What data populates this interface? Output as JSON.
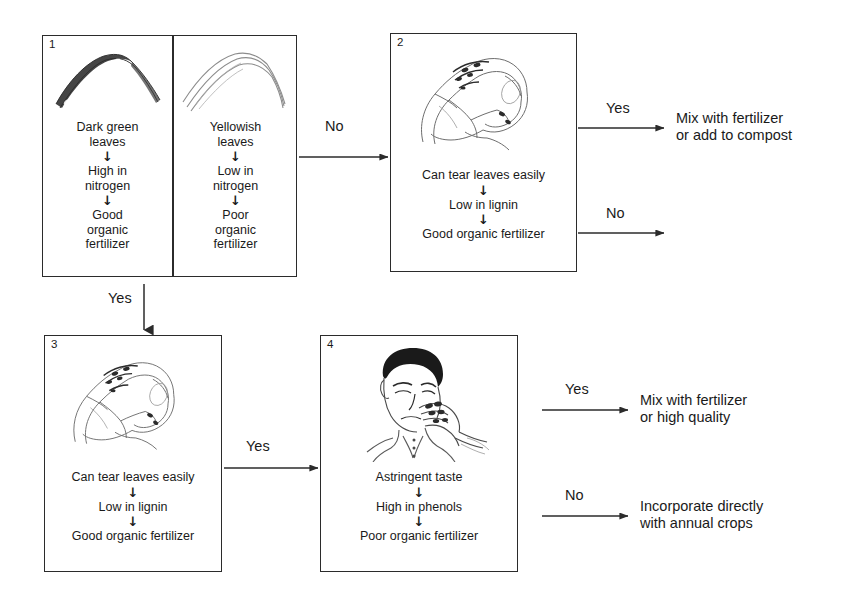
{
  "diagram": {
    "line_color": "#2b2b2b",
    "text_color": "#1a1a1a",
    "background": "#ffffff",
    "down_arrow_glyph": "↓"
  },
  "boxes": [
    {
      "id": "box-1",
      "number": "1",
      "panes": [
        {
          "id": "box-1-left",
          "sketch": "dark-green-leaf-sketch",
          "steps": [
            "Dark green\nleaves",
            "High in\nnitrogen",
            "Good\norganic\nfertilizer"
          ]
        },
        {
          "id": "box-1-right",
          "sketch": "yellowish-leaf-sketch",
          "steps": [
            "Yellowish\nleaves",
            "Low in\nnitrogen",
            "Poor\norganic\nfertilizer"
          ]
        }
      ]
    },
    {
      "id": "box-2",
      "number": "2",
      "panes": [
        {
          "id": "box-2-main",
          "sketch": "hands-tearing-leaf-sketch",
          "steps": [
            "Can tear leaves easily",
            "Low in lignin",
            "Good organic fertilizer"
          ]
        }
      ]
    },
    {
      "id": "box-3",
      "number": "3",
      "panes": [
        {
          "id": "box-3-main",
          "sketch": "hands-tearing-leaf-sketch",
          "steps": [
            "Can tear leaves easily",
            "Low in lignin",
            "Good organic fertilizer"
          ]
        }
      ]
    },
    {
      "id": "box-4",
      "number": "4",
      "panes": [
        {
          "id": "box-4-main",
          "sketch": "person-tasting-leaf-sketch",
          "steps": [
            "Astringent taste",
            "High in phenols",
            "Poor organic fertilizer"
          ]
        }
      ]
    }
  ],
  "connectors": [
    {
      "id": "c1",
      "label": "No",
      "from": "box-1",
      "to": "box-2"
    },
    {
      "id": "c2",
      "label": "Yes",
      "from": "box-1",
      "to": "box-3"
    },
    {
      "id": "c3",
      "label": "Yes",
      "from": "box-2",
      "to": "outcome-1"
    },
    {
      "id": "c4",
      "label": "No",
      "from": "box-2",
      "to": ""
    },
    {
      "id": "c5",
      "label": "Yes",
      "from": "box-3",
      "to": "box-4"
    },
    {
      "id": "c6",
      "label": "Yes",
      "from": "box-4",
      "to": "outcome-2"
    },
    {
      "id": "c7",
      "label": "No",
      "from": "box-4",
      "to": "outcome-3"
    }
  ],
  "outcomes": [
    {
      "id": "outcome-1",
      "text": "Mix with fertilizer\nor add to compost"
    },
    {
      "id": "outcome-2",
      "text": "Mix with fertilizer\nor high quality"
    },
    {
      "id": "outcome-3",
      "text": "Incorporate directly\nwith annual crops"
    }
  ]
}
